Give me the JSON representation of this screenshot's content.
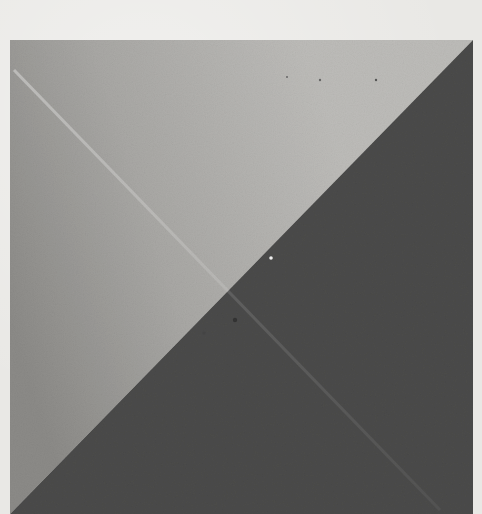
{
  "image": {
    "description": "Scanned photograph of a square divided diagonally into two triangles",
    "background_color": "#e9e8e5",
    "square": {
      "left": 10,
      "top": 40,
      "width": 463,
      "height": 474
    },
    "upper_left_triangle": {
      "tone": "light gray",
      "color_light": "#b9b8b5",
      "color_dark": "#8f8e8b"
    },
    "lower_right_triangle": {
      "tone": "dark gray",
      "color": "#4a4a4a"
    },
    "faint_diagonal_streak": {
      "from": "top-left corner",
      "to": "bottom-right corner"
    }
  }
}
